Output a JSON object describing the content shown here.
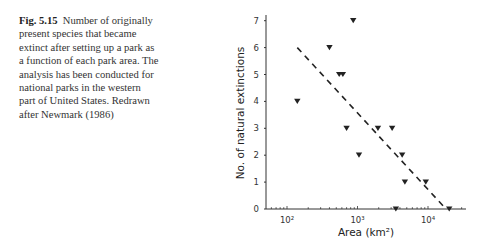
{
  "caption": {
    "label": "Fig. 5.15",
    "text": "Number of originally present species that became extinct after setting up a park as a function of each park area. The analysis has been conducted for national parks in the western part of United States. Redrawn after Newmark (1986)"
  },
  "chart_data": {
    "type": "scatter",
    "title": "",
    "xlabel": "Area (km²)",
    "ylabel": "No. of natural extinctions",
    "xscale": "log",
    "xlim": [
      50,
      30000
    ],
    "ylim": [
      0,
      7.3
    ],
    "x_ticks": [
      {
        "value": 100,
        "label": "10²"
      },
      {
        "value": 1000,
        "label": "10³"
      },
      {
        "value": 10000,
        "label": "10⁴"
      }
    ],
    "y_ticks": [
      0,
      1,
      2,
      3,
      4,
      5,
      6,
      7
    ],
    "grid": false,
    "marker": "inverted-triangle",
    "series": [
      {
        "name": "National parks",
        "points": [
          {
            "x": 140,
            "y": 4
          },
          {
            "x": 400,
            "y": 6
          },
          {
            "x": 550,
            "y": 5
          },
          {
            "x": 620,
            "y": 5
          },
          {
            "x": 700,
            "y": 3
          },
          {
            "x": 870,
            "y": 7
          },
          {
            "x": 1050,
            "y": 2
          },
          {
            "x": 1950,
            "y": 3
          },
          {
            "x": 3100,
            "y": 3
          },
          {
            "x": 3500,
            "y": 0
          },
          {
            "x": 4300,
            "y": 2
          },
          {
            "x": 4700,
            "y": 1
          },
          {
            "x": 9300,
            "y": 1
          },
          {
            "x": 20000,
            "y": 0
          }
        ]
      }
    ],
    "trend_line": {
      "style": "dashed",
      "from": {
        "x": 140,
        "y": 6
      },
      "to": {
        "x": 18000,
        "y": 0
      }
    }
  }
}
